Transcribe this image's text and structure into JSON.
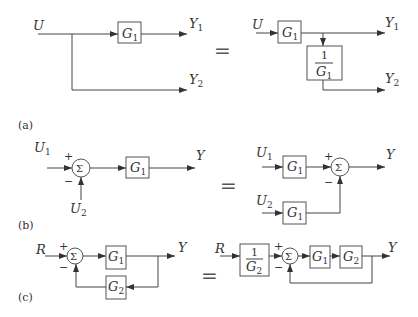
{
  "diagram": {
    "type": "block-diagram-equivalences",
    "parts": [
      {
        "caption": "(a)",
        "description": "Moving a pickoff point past a block",
        "left": {
          "input": "U",
          "blocks": [
            "G1"
          ],
          "outputs": [
            "Y1",
            "Y2"
          ]
        },
        "equals": "=",
        "right": {
          "input": "U",
          "blocks": [
            "G1",
            "1/G1"
          ],
          "outputs": [
            "Y1",
            "Y2"
          ]
        }
      },
      {
        "caption": "(b)",
        "description": "Moving a summing junction past a block",
        "left": {
          "inputs": [
            "U1",
            "U2"
          ],
          "signs": [
            "+",
            "−"
          ],
          "blocks": [
            "G1"
          ],
          "output": "Y"
        },
        "equals": "=",
        "right": {
          "inputs": [
            "U1",
            "U2"
          ],
          "signs": [
            "+",
            "−"
          ],
          "blocks": [
            "G1",
            "G1"
          ],
          "output": "Y"
        }
      },
      {
        "caption": "(c)",
        "description": "Converting to unity feedback",
        "left": {
          "input": "R",
          "signs": [
            "+",
            "−"
          ],
          "blocks": [
            "G1",
            "G2"
          ],
          "output": "Y"
        },
        "equals": "=",
        "right": {
          "input": "R",
          "signs": [
            "+",
            "−"
          ],
          "blocks": [
            "1/G2",
            "G1",
            "G2"
          ],
          "output": "Y"
        }
      }
    ]
  },
  "labels": {
    "U": "U",
    "Y": "Y",
    "R": "R",
    "G": "G",
    "one": "1",
    "sigma": "Σ",
    "plus": "+",
    "minus": "−",
    "eq": "=",
    "s1": "1",
    "s2": "2",
    "cap_a": "(a)",
    "cap_b": "(b)",
    "cap_c": "(c)"
  }
}
